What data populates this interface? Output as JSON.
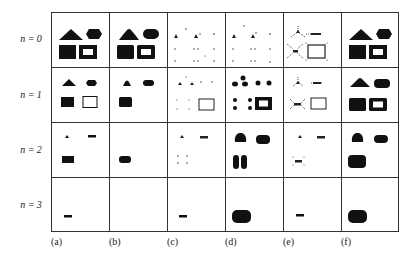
{
  "figure": {
    "row_labels": [
      "n = 0",
      "n = 1",
      "n = 2",
      "n = 3"
    ],
    "column_labels": [
      "(a)",
      "(b)",
      "(c)",
      "(d)",
      "(e)",
      "(f)"
    ]
  },
  "cells": {
    "n0": {
      "a": "triangle, hexagon, solid-rect, hollow-rect (full)",
      "b": "rounded triangle, rounded hexagon, solid-rect, hollow-rect",
      "c": "sparse skeleton points",
      "d": "sparse skeleton points",
      "e": "dotted skeleton outlines with hollow rect",
      "f": "triangle, hexagon, solid-rect, hollow-rect (full)"
    },
    "n1": {
      "a": "small triangle, small hexagon, solid-rect, thin hollow-rect",
      "b": "small rounded triangle, small hexagon, solid-rect",
      "c": "skeleton points with thin hollow rect",
      "d": "dots and thick hollow rect",
      "e": "dotted skeletons with thin hollow rect",
      "f": "triangle, hexagon, solid-rect, hollow-rect"
    },
    "n2": {
      "a": "tiny triangle, dash, small solid-rect",
      "b": "small rounded solid-rect",
      "c": "tiny triangle, dash, four dots",
      "d": "rounded blob, rounded bar, two vertical blobs",
      "e": "tiny triangle, dash, small dotted x",
      "f": "rounded blob, rounded bar, rounded rect"
    },
    "n3": {
      "a": "dash",
      "b": "",
      "c": "dash",
      "d": "large rounded rect",
      "e": "dash",
      "f": "large rounded rect"
    }
  },
  "colors": {
    "ink": "#111111",
    "grid": "#333333",
    "background": "#ffffff"
  }
}
